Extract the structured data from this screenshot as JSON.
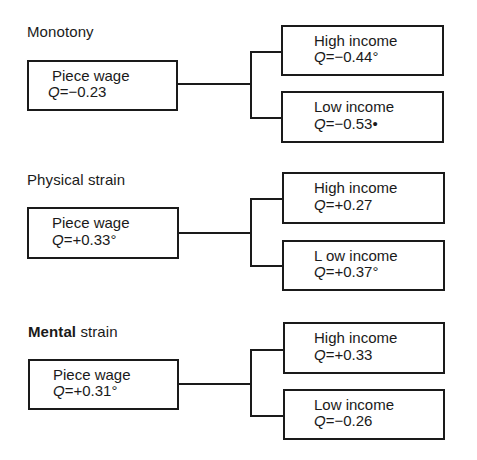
{
  "sections": [
    {
      "title_bold": "",
      "title_rest": "Monotony",
      "root": {
        "label": "Piece wage",
        "q_symbol": "Q",
        "q_value": "=−0.23"
      },
      "high": {
        "label": "High income",
        "q_symbol": "Q",
        "q_value": "=−0.44°"
      },
      "low": {
        "label": "Low income",
        "q_symbol": "Q",
        "q_value": "=−0.53•"
      }
    },
    {
      "title_bold": "",
      "title_rest": "Physical strain",
      "root": {
        "label": "Piece wage",
        "q_symbol": "Q",
        "q_value": "=+0.33°"
      },
      "high": {
        "label": "High income",
        "q_symbol": "Q",
        "q_value": "=+0.27"
      },
      "low": {
        "label": "L ow income",
        "q_symbol": "Q",
        "q_value": "=+0.37°"
      }
    },
    {
      "title_bold": "Mental",
      "title_rest": " strain",
      "root": {
        "label": "Piece wage",
        "q_symbol": "Q",
        "q_value": "=+0.31°"
      },
      "high": {
        "label": "High income",
        "q_symbol": "Q",
        "q_value": "=+0.33"
      },
      "low": {
        "label": "Low income",
        "q_symbol": "Q",
        "q_value": "=−0.26"
      }
    }
  ]
}
